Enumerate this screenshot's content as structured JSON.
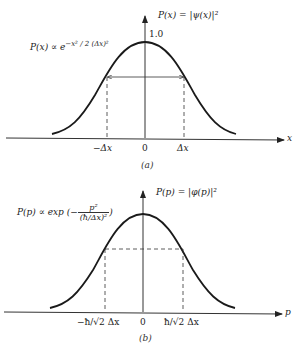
{
  "panel_a": {
    "caption": "(a)",
    "y_label": "P(x) = |ψ(x)|²",
    "peak_label": "1.0",
    "formula": "P(x) ∝ e^{−x²/2(Δx)²}",
    "formula_base": "P(x) ∝ e",
    "formula_exp": "−x² / 2 (Δx)²",
    "x_axis_label": "x",
    "ticks": [
      "−Δx",
      "0",
      "Δx"
    ],
    "width_marker": "double-arrow between −Δx and Δx"
  },
  "panel_b": {
    "caption": "(b)",
    "y_label": "P(p) = |φ(p)|²",
    "formula_prefix": "P(p) ∝ exp (−",
    "formula_num": "p²",
    "formula_den": "(ħ/Δx)²",
    "formula_suffix": ")",
    "x_axis_label": "p",
    "ticks": [
      "−ħ/√2 Δx",
      "0",
      "ħ/√2 Δx"
    ],
    "width_marker": "dashed box between −ħ/√2Δx and ħ/√2Δx"
  },
  "colors": {
    "ink": "#222222",
    "background": "#ffffff"
  }
}
